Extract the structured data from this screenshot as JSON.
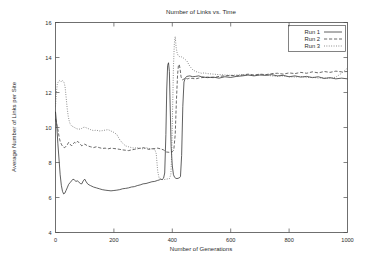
{
  "chart_data": {
    "type": "line",
    "title": "Number of Links vs. Time",
    "xlabel": "Number of Generations",
    "ylabel": "Average Number of Links per Site",
    "xlim": [
      0,
      1000
    ],
    "ylim": [
      4,
      16
    ],
    "xticks": [
      0,
      200,
      400,
      600,
      800,
      1000
    ],
    "yticks": [
      4,
      6,
      8,
      10,
      12,
      14,
      16
    ],
    "xtick_labels": [
      "0",
      "200",
      "400",
      "600",
      "800",
      "1000"
    ],
    "ytick_labels": [
      "4",
      "6",
      "8",
      "10",
      "12",
      "14",
      "16"
    ],
    "grid": false,
    "legend_position": "top-right",
    "legend": [
      "Run 1",
      "Run 2",
      "Run 3"
    ],
    "line_styles": [
      "solid",
      "dashed",
      "dotted"
    ],
    "colors": [
      "#2b2b2b",
      "#3a3a3a",
      "#5a5a5a"
    ],
    "series": [
      {
        "name": "Run 1",
        "style": "solid",
        "color": "#2b2b2b",
        "x": [
          0,
          4,
          8,
          12,
          16,
          20,
          24,
          28,
          32,
          36,
          40,
          45,
          50,
          55,
          60,
          65,
          70,
          75,
          80,
          85,
          90,
          95,
          100,
          105,
          110,
          115,
          120,
          130,
          140,
          150,
          160,
          170,
          180,
          190,
          200,
          210,
          220,
          230,
          240,
          250,
          260,
          270,
          280,
          290,
          300,
          310,
          320,
          330,
          340,
          350,
          355,
          360,
          365,
          370,
          374,
          378,
          381,
          384,
          387,
          390,
          393,
          396,
          400,
          404,
          408,
          412,
          416,
          420,
          424,
          428,
          432,
          436,
          440,
          445,
          450,
          460,
          470,
          480,
          490,
          500,
          520,
          540,
          560,
          580,
          600,
          620,
          640,
          660,
          680,
          700,
          720,
          740,
          760,
          780,
          800,
          820,
          840,
          860,
          880,
          900,
          920,
          940,
          960,
          980,
          1000
        ],
        "y": [
          10.9,
          10.2,
          9.1,
          8.2,
          7.3,
          6.7,
          6.35,
          6.2,
          6.25,
          6.4,
          6.55,
          6.75,
          6.85,
          6.95,
          7.05,
          7.0,
          6.92,
          6.95,
          6.88,
          6.8,
          6.78,
          6.95,
          7.05,
          6.9,
          6.78,
          6.72,
          6.68,
          6.6,
          6.55,
          6.5,
          6.45,
          6.42,
          6.4,
          6.38,
          6.4,
          6.42,
          6.45,
          6.5,
          6.52,
          6.55,
          6.6,
          6.62,
          6.68,
          6.72,
          6.78,
          6.8,
          6.85,
          6.9,
          6.92,
          6.98,
          7.0,
          7.05,
          7.02,
          7.1,
          7.4,
          9.6,
          12.2,
          13.55,
          13.7,
          13.2,
          11.0,
          8.9,
          7.8,
          7.3,
          7.15,
          7.1,
          7.08,
          7.1,
          7.12,
          7.2,
          8.4,
          11.2,
          12.6,
          12.85,
          12.92,
          12.95,
          12.9,
          12.92,
          12.95,
          12.9,
          12.85,
          12.88,
          12.82,
          12.9,
          12.86,
          12.92,
          12.95,
          13.0,
          12.95,
          13.0,
          12.98,
          13.02,
          12.95,
          12.98,
          12.9,
          12.95,
          12.88,
          12.92,
          12.85,
          12.9,
          12.8,
          12.85,
          12.78,
          12.82,
          12.78
        ]
      },
      {
        "name": "Run 2",
        "style": "dashed",
        "color": "#3a3a3a",
        "x": [
          0,
          4,
          8,
          12,
          16,
          20,
          25,
          30,
          35,
          40,
          45,
          50,
          55,
          60,
          65,
          70,
          75,
          80,
          85,
          90,
          95,
          100,
          110,
          120,
          130,
          140,
          150,
          160,
          170,
          180,
          190,
          200,
          210,
          220,
          230,
          240,
          250,
          260,
          270,
          280,
          290,
          300,
          310,
          320,
          330,
          340,
          350,
          360,
          370,
          380,
          390,
          395,
          400,
          405,
          410,
          414,
          418,
          421,
          424,
          427,
          430,
          433,
          436,
          440,
          444,
          448,
          452,
          456,
          460,
          470,
          480,
          490,
          500,
          520,
          540,
          560,
          580,
          600,
          620,
          640,
          660,
          680,
          700,
          720,
          740,
          760,
          780,
          800,
          820,
          840,
          860,
          880,
          900,
          920,
          940,
          960,
          980,
          1000
        ],
        "y": [
          10.5,
          10.2,
          9.9,
          9.5,
          9.2,
          9.05,
          8.9,
          8.85,
          8.9,
          9.0,
          9.15,
          9.05,
          8.95,
          9.05,
          9.15,
          9.1,
          9.2,
          9.15,
          9.05,
          8.95,
          9.0,
          9.05,
          8.95,
          8.9,
          8.85,
          8.9,
          8.85,
          8.8,
          8.82,
          8.78,
          8.82,
          8.8,
          8.78,
          8.75,
          8.72,
          8.7,
          8.68,
          8.72,
          8.75,
          8.78,
          8.82,
          8.85,
          8.8,
          8.75,
          8.78,
          8.8,
          8.82,
          8.78,
          8.72,
          8.6,
          8.58,
          8.6,
          8.62,
          8.7,
          9.6,
          11.5,
          13.0,
          13.55,
          13.6,
          13.3,
          12.9,
          12.75,
          12.72,
          12.78,
          12.82,
          12.8,
          12.78,
          12.8,
          12.82,
          12.8,
          12.78,
          12.82,
          12.85,
          12.88,
          12.85,
          12.92,
          12.95,
          12.98,
          12.95,
          13.0,
          13.05,
          13.0,
          13.05,
          13.02,
          13.08,
          13.1,
          13.05,
          13.12,
          13.08,
          13.15,
          13.1,
          13.18,
          13.12,
          13.2,
          13.15,
          13.22,
          13.18,
          13.2
        ]
      },
      {
        "name": "Run 3",
        "style": "dotted",
        "color": "#5a5a5a",
        "x": [
          0,
          3,
          6,
          9,
          12,
          15,
          18,
          21,
          24,
          27,
          30,
          33,
          36,
          40,
          44,
          48,
          52,
          56,
          60,
          65,
          70,
          75,
          80,
          85,
          90,
          95,
          100,
          110,
          120,
          130,
          140,
          150,
          160,
          170,
          180,
          190,
          200,
          210,
          220,
          230,
          240,
          250,
          260,
          270,
          280,
          290,
          300,
          310,
          320,
          330,
          340,
          345,
          350,
          355,
          360,
          370,
          380,
          390,
          395,
          398,
          401,
          404,
          407,
          410,
          413,
          416,
          420,
          425,
          430,
          435,
          440,
          450,
          460,
          470,
          480,
          490,
          500,
          510,
          520,
          540,
          560,
          580,
          600,
          620,
          640,
          660,
          680,
          700,
          720,
          740,
          760,
          780,
          800,
          820,
          840,
          860,
          880,
          900,
          920,
          940,
          960,
          980,
          1000
        ],
        "y": [
          11.2,
          12.0,
          12.45,
          12.6,
          12.65,
          12.7,
          12.65,
          12.6,
          12.68,
          12.62,
          12.55,
          12.3,
          11.8,
          11.1,
          10.6,
          10.3,
          10.15,
          10.08,
          10.05,
          10.0,
          9.95,
          9.92,
          9.9,
          9.92,
          9.95,
          10.0,
          10.02,
          9.95,
          9.88,
          9.82,
          9.85,
          9.8,
          9.82,
          9.85,
          9.88,
          9.8,
          9.72,
          9.6,
          9.3,
          9.1,
          8.95,
          8.9,
          8.85,
          8.82,
          8.85,
          8.8,
          8.78,
          8.85,
          8.8,
          8.78,
          8.75,
          8.5,
          7.5,
          7.1,
          7.05,
          7.02,
          7.05,
          7.08,
          7.3,
          8.5,
          11.0,
          13.5,
          14.8,
          15.2,
          14.6,
          14.3,
          14.1,
          14.05,
          14.05,
          14.0,
          13.95,
          13.8,
          13.5,
          13.3,
          13.2,
          13.15,
          13.1,
          13.12,
          13.08,
          13.05,
          13.02,
          13.0,
          12.98,
          13.0,
          13.02,
          13.0,
          12.98,
          13.02,
          13.0,
          12.95,
          12.92,
          12.95,
          12.9,
          12.88,
          12.92,
          12.85,
          12.88,
          12.82,
          12.85,
          12.8,
          12.88,
          13.1,
          13.4
        ]
      }
    ]
  }
}
